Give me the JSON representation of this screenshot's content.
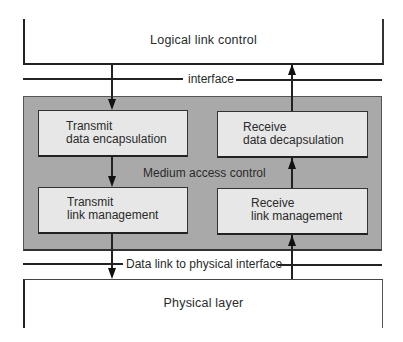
{
  "diagram": {
    "top_layer": {
      "label": "Logical link control"
    },
    "upper_interface": {
      "label": "interface"
    },
    "mac_sublayer": {
      "label": "Medium access control",
      "fill_color": "#a9a9a9",
      "boxes": [
        {
          "id": "tx-encap",
          "line1": "Transmit",
          "line2": "data encapsulation"
        },
        {
          "id": "rx-decap",
          "line1": "Receive",
          "line2": "data decapsulation"
        },
        {
          "id": "tx-link",
          "line1": "Transmit",
          "line2": "link management"
        },
        {
          "id": "rx-link",
          "line1": "Receive",
          "line2": "link management"
        }
      ],
      "box_fill_color": "#e7e7e7"
    },
    "lower_interface": {
      "label": "Data link to physical interface"
    },
    "bottom_layer": {
      "label": "Physical layer"
    },
    "flows": [
      {
        "from": "Logical link control",
        "to": "Transmit data encapsulation",
        "direction": "down"
      },
      {
        "from": "Transmit data encapsulation",
        "to": "Transmit link management",
        "direction": "down"
      },
      {
        "from": "Transmit link management",
        "to": "Physical layer",
        "direction": "down"
      },
      {
        "from": "Physical layer",
        "to": "Receive link management",
        "direction": "up"
      },
      {
        "from": "Receive link management",
        "to": "Receive data decapsulation",
        "direction": "up"
      },
      {
        "from": "Receive data decapsulation",
        "to": "Logical link control",
        "direction": "up"
      }
    ]
  }
}
